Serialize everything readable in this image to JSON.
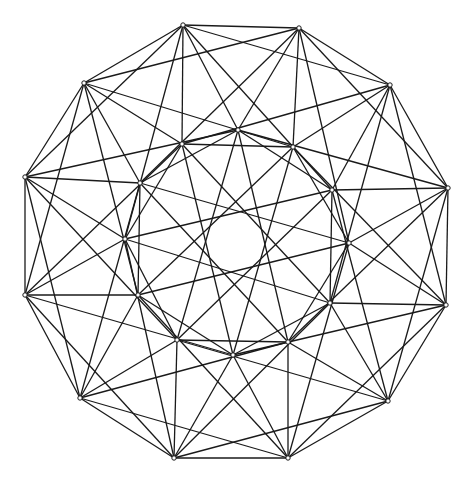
{
  "diagram": {
    "type": "graph",
    "colors": {
      "edge": "#1a1a1a",
      "node_fill": "#ffffff",
      "background": "#ffffff"
    },
    "outer_vertices": [
      [
        183,
        25
      ],
      [
        299,
        28
      ],
      [
        390,
        85
      ],
      [
        448,
        188
      ],
      [
        446,
        305
      ],
      [
        388,
        401
      ],
      [
        288,
        458
      ],
      [
        174,
        458
      ],
      [
        80,
        398
      ],
      [
        25,
        295
      ],
      [
        25,
        177
      ],
      [
        84,
        83
      ]
    ],
    "inner_vertices": [
      [
        182,
        144
      ],
      [
        238,
        130
      ],
      [
        293,
        147
      ],
      [
        332,
        190
      ],
      [
        349,
        243
      ],
      [
        330,
        303
      ],
      [
        288,
        342
      ],
      [
        233,
        355
      ],
      [
        177,
        340
      ],
      [
        138,
        295
      ],
      [
        125,
        239
      ],
      [
        140,
        183
      ]
    ],
    "edge_rules": {
      "outer_outer_offsets": [
        1,
        2
      ],
      "outer_inner_offsets": [
        0,
        1,
        3,
        -2
      ],
      "inner_inner_offsets": [
        2,
        5
      ]
    }
  }
}
